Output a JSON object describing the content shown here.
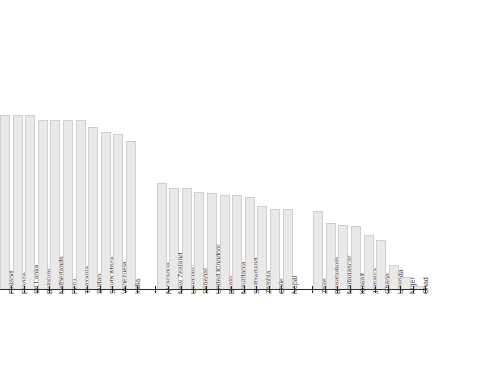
{
  "chart_data": {
    "type": "bar",
    "title": "",
    "subtitle": "",
    "xlabel": "",
    "ylabel": "",
    "grid": false,
    "legend": false,
    "legend_position": "none",
    "axis": {
      "baseline_visible": true,
      "ticks_visible": true,
      "y_axis_visible": false,
      "ylim": [
        0,
        100
      ]
    },
    "style": {
      "bar_fill": "#e9e9e9",
      "bar_border": "#cfcfcf",
      "axis_color": "#2b2b2b",
      "label_color": "#4a4a4a",
      "background": "#ffffff"
    },
    "groups": [
      {
        "name": "group-1",
        "categories": [
          "Finland",
          "France",
          "Sri Lanka",
          "Belgium",
          "Netherlands",
          "Peru",
          "Tanzania",
          "Sudan",
          "South Africa",
          "Venezuela",
          "India"
        ],
        "values": [
          100,
          100,
          100,
          97,
          97,
          97,
          97,
          93,
          90,
          89,
          85
        ]
      },
      {
        "name": "group-2",
        "categories": [
          "Nicaragua",
          "New Zealand",
          "Uruguay",
          "Senegal",
          "United Kingdom",
          "Benin",
          "Mauritania",
          "Switzerland",
          "Zambia",
          "Chile",
          "Nepal"
        ],
        "values": [
          61,
          58,
          58,
          56,
          55,
          54,
          54,
          53,
          48,
          46,
          46
        ]
      },
      {
        "name": "group-3",
        "categories": [
          "Zaire",
          "Bangladesh",
          "Madagascar",
          "Kuwait",
          "Jamaica",
          "Ghana",
          "Uganda",
          "Niger",
          "Chad"
        ],
        "values": [
          45,
          38,
          37,
          36,
          31,
          28,
          14,
          7,
          2
        ]
      }
    ],
    "categories": [
      "Finland",
      "France",
      "Sri Lanka",
      "Belgium",
      "Netherlands",
      "Peru",
      "Tanzania",
      "Sudan",
      "South Africa",
      "Venezuela",
      "India",
      "Nicaragua",
      "New Zealand",
      "Uruguay",
      "Senegal",
      "United Kingdom",
      "Benin",
      "Mauritania",
      "Switzerland",
      "Zambia",
      "Chile",
      "Nepal",
      "Zaire",
      "Bangladesh",
      "Madagascar",
      "Kuwait",
      "Jamaica",
      "Ghana",
      "Uganda",
      "Niger",
      "Chad"
    ],
    "values": [
      100,
      100,
      100,
      97,
      97,
      97,
      97,
      93,
      90,
      89,
      85,
      61,
      58,
      58,
      56,
      55,
      54,
      54,
      53,
      48,
      46,
      46,
      45,
      38,
      37,
      36,
      31,
      28,
      14,
      7,
      2
    ]
  }
}
